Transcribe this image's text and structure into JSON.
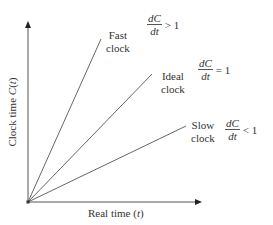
{
  "diagram": {
    "x_axis": {
      "label": "Real time",
      "var": "t"
    },
    "y_axis": {
      "label": "Clock time",
      "func": "C",
      "var": "t"
    },
    "lines": [
      {
        "name": "Fast clock",
        "label_line1": "Fast",
        "label_line2": "clock",
        "deriv_num": "dC",
        "deriv_den": "dt",
        "relation": "> 1"
      },
      {
        "name": "Ideal clock",
        "label_line1": "Ideal",
        "label_line2": "clock",
        "deriv_num": "dC",
        "deriv_den": "dt",
        "relation": "= 1"
      },
      {
        "name": "Slow clock",
        "label_line1": "Slow",
        "label_line2": "clock",
        "deriv_num": "dC",
        "deriv_den": "dt",
        "relation": "< 1"
      }
    ],
    "colors": {
      "line": "#555555",
      "text": "#333333",
      "background": "#ffffff"
    }
  }
}
